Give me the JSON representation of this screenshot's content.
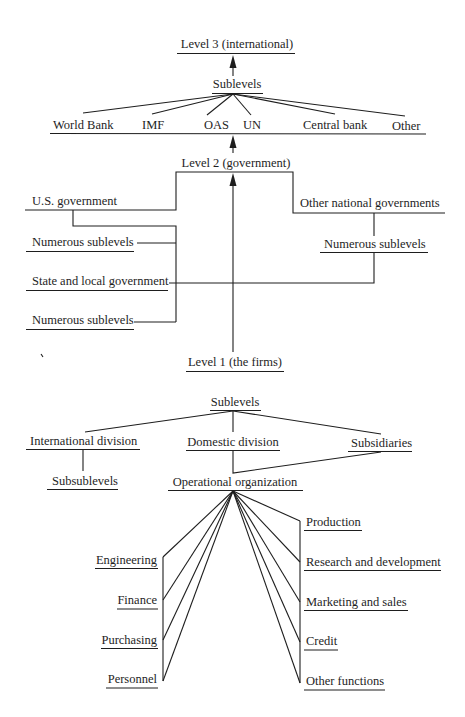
{
  "diagram": {
    "international": {
      "level_label": "Level 3 (international)",
      "sublevels_label": "Sublevels",
      "members": [
        "World Bank",
        "IMF",
        "OAS",
        "UN",
        "Central bank",
        "Other"
      ]
    },
    "government": {
      "level_label": "Level 2 (government)",
      "us_government": "U.S. government",
      "us_sublevels_1": "Numerous sublevels",
      "state_local": "State and local government",
      "us_sublevels_2": "Numerous sublevels",
      "other_national": "Other national governments",
      "other_sublevels": "Numerous sublevels"
    },
    "firms": {
      "level_label": "Level 1 (the firms)",
      "sublevels_label": "Sublevels",
      "international_division": "International division",
      "subsublevels": "Subsublevels",
      "domestic_division": "Domestic division",
      "subsidiaries": "Subsidiaries",
      "operational_organization": "Operational organization",
      "left_functions": [
        "Engineering",
        "Finance",
        "Purchasing",
        "Personnel"
      ],
      "right_functions": [
        "Production",
        "Research and development",
        "Marketing and sales",
        "Credit",
        "Other functions"
      ]
    },
    "edges": [
      [
        "Sublevels (international)",
        "Level 3 (international)",
        "arrow"
      ],
      [
        "Sublevels (international)",
        "World Bank"
      ],
      [
        "Sublevels (international)",
        "IMF"
      ],
      [
        "Sublevels (international)",
        "OAS"
      ],
      [
        "Sublevels (international)",
        "UN"
      ],
      [
        "Sublevels (international)",
        "Central bank"
      ],
      [
        "Sublevels (international)",
        "Other"
      ],
      [
        "Level 2 (government)",
        "International members baseline",
        "arrow"
      ],
      [
        "Level 2 (government)",
        "U.S. government"
      ],
      [
        "Level 2 (government)",
        "Other national governments"
      ],
      [
        "U.S. government",
        "Numerous sublevels"
      ],
      [
        "U.S. government",
        "State and local government"
      ],
      [
        "U.S. government",
        "Numerous sublevels"
      ],
      [
        "Other national governments",
        "Numerous sublevels"
      ],
      [
        "Numerous sublevels (other)",
        "State and local government"
      ],
      [
        "Level 1 (the firms)",
        "Level 2 (government)",
        "arrow"
      ],
      [
        "Sublevels (firms)",
        "International division"
      ],
      [
        "Sublevels (firms)",
        "Domestic division"
      ],
      [
        "Sublevels (firms)",
        "Subsidiaries"
      ],
      [
        "International division",
        "Subsublevels"
      ],
      [
        "Domestic division",
        "Operational organization"
      ],
      [
        "Subsidiaries",
        "Operational organization"
      ],
      [
        "Operational organization",
        "Engineering"
      ],
      [
        "Operational organization",
        "Finance"
      ],
      [
        "Operational organization",
        "Purchasing"
      ],
      [
        "Operational organization",
        "Personnel"
      ],
      [
        "Operational organization",
        "Production"
      ],
      [
        "Operational organization",
        "Research and development"
      ],
      [
        "Operational organization",
        "Marketing and sales"
      ],
      [
        "Operational organization",
        "Credit"
      ],
      [
        "Operational organization",
        "Other functions"
      ]
    ]
  }
}
